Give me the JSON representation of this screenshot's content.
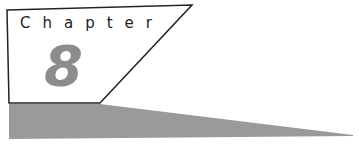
{
  "heading": {
    "label": "Chapter",
    "number": "8"
  },
  "colors": {
    "box_border": "#222222",
    "number_fill": "#8c8c8c",
    "wedge_fill": "#9a9a9a"
  }
}
